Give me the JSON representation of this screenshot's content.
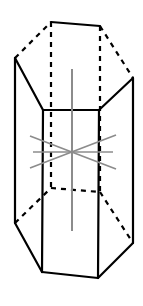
{
  "figure": {
    "canvas": {
      "width": 143,
      "height": 306,
      "background": "#ffffff"
    },
    "colors": {
      "edge": "#000000",
      "hidden_edge": "#000000",
      "axis": "#8c8c8c",
      "face": "#ffffff"
    },
    "line_styles": {
      "visible_edge": "solid",
      "hidden_edge": "dashed",
      "axis": "solid-gray"
    },
    "solid": {
      "name": "hexagonal prism",
      "faces": 8,
      "vertices": 12,
      "edges": 18
    },
    "geometry": {
      "top_hexagon": [
        {
          "id": "T1",
          "x": 51,
          "y": 22
        },
        {
          "id": "T2",
          "x": 100,
          "y": 26
        },
        {
          "id": "T3",
          "x": 133,
          "y": 78
        },
        {
          "id": "T4",
          "x": 99,
          "y": 110
        },
        {
          "id": "T5",
          "x": 43,
          "y": 110
        },
        {
          "id": "T6",
          "x": 15,
          "y": 58
        }
      ],
      "bottom_hexagon": [
        {
          "id": "B1",
          "x": 51,
          "y": 188
        },
        {
          "id": "B2",
          "x": 100,
          "y": 192
        },
        {
          "id": "B3",
          "x": 133,
          "y": 243
        },
        {
          "id": "B4",
          "x": 98,
          "y": 278
        },
        {
          "id": "B5",
          "x": 42,
          "y": 272
        },
        {
          "id": "B6",
          "x": 15,
          "y": 223
        }
      ],
      "vertical_edges": [
        {
          "id": "E-left",
          "x": 15,
          "y1": 58,
          "y2": 223,
          "hidden": false
        },
        {
          "id": "E-front-left",
          "x": 43,
          "y1": 110,
          "y2": 272,
          "hidden": false
        },
        {
          "id": "E-front-right",
          "x": 99,
          "y1": 110,
          "y2": 278,
          "hidden": false
        },
        {
          "id": "E-right",
          "x": 133,
          "y1": 78,
          "y2": 243,
          "hidden": false
        },
        {
          "id": "E-back-left",
          "x": 51,
          "y1": 22,
          "y2": 188,
          "hidden": true
        },
        {
          "id": "E-back-right",
          "x": 100,
          "y1": 26,
          "y2": 192,
          "hidden": true
        }
      ],
      "center": {
        "x": 72,
        "y": 152
      }
    },
    "axes": [
      {
        "id": "axis-principal-vertical",
        "label": "principal 6-fold axis",
        "x1": 72,
        "y1": 69,
        "x2": 72,
        "y2": 231
      },
      {
        "id": "axis-diagonal-up-right",
        "label": "2-fold axis",
        "x1": 30,
        "y1": 168,
        "x2": 116,
        "y2": 135
      },
      {
        "id": "axis-diagonal-down-right",
        "label": "2-fold axis",
        "x1": 30,
        "y1": 136,
        "x2": 116,
        "y2": 169
      },
      {
        "id": "axis-horizontal",
        "label": "2-fold axis",
        "x1": 33,
        "y1": 152,
        "x2": 113,
        "y2": 152
      }
    ]
  }
}
